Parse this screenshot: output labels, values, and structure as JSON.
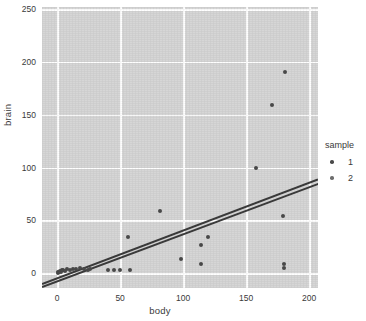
{
  "chart_data": {
    "type": "scatter",
    "title": "",
    "xlabel": "body",
    "ylabel": "brain",
    "xlim": [
      -12,
      207
    ],
    "ylim": [
      -14,
      252
    ],
    "xticks": [
      0,
      50,
      100,
      150,
      200
    ],
    "yticks": [
      0,
      50,
      100,
      150,
      200,
      250
    ],
    "grid": true,
    "legend": {
      "title": "sample",
      "position": "right",
      "entries": [
        {
          "label": "1",
          "color": "#4a4a4a"
        },
        {
          "label": "2",
          "color": "#6e6e6e"
        }
      ]
    },
    "series": [
      {
        "name": "1",
        "color": "#4a4a4a",
        "points": [
          {
            "x": 0.5,
            "y": 0.4
          },
          {
            "x": 1.0,
            "y": 0.9
          },
          {
            "x": 1.8,
            "y": 1.2
          },
          {
            "x": 2.5,
            "y": 2.0
          },
          {
            "x": 3.2,
            "y": 1.6
          },
          {
            "x": 4.0,
            "y": 2.8
          },
          {
            "x": 5.0,
            "y": 3.2
          },
          {
            "x": 6.5,
            "y": 2.4
          },
          {
            "x": 8.0,
            "y": 3.6
          },
          {
            "x": 10.0,
            "y": 3.0
          },
          {
            "x": 12.5,
            "y": 4.2
          },
          {
            "x": 15.0,
            "y": 3.8
          },
          {
            "x": 18.0,
            "y": 4.6
          },
          {
            "x": 21.0,
            "y": 4.0
          },
          {
            "x": 24.5,
            "y": 3.4
          },
          {
            "x": 26.0,
            "y": 3.6
          },
          {
            "x": 40.0,
            "y": 3.0
          },
          {
            "x": 45.0,
            "y": 2.6
          },
          {
            "x": 50.0,
            "y": 3.0
          },
          {
            "x": 57.5,
            "y": 3.2
          },
          {
            "x": 56.5,
            "y": 34.0
          },
          {
            "x": 81.5,
            "y": 59.0
          },
          {
            "x": 98.0,
            "y": 13.0
          },
          {
            "x": 114.0,
            "y": 9.0
          },
          {
            "x": 114.5,
            "y": 26.5
          },
          {
            "x": 120.0,
            "y": 34.5
          },
          {
            "x": 157.5,
            "y": 100.0
          },
          {
            "x": 170.5,
            "y": 159.0
          },
          {
            "x": 179.5,
            "y": 54.5
          },
          {
            "x": 180.0,
            "y": 8.5
          },
          {
            "x": 180.0,
            "y": 4.5
          },
          {
            "x": 181.0,
            "y": 190.5
          }
        ]
      }
    ],
    "fits": [
      {
        "name": "1",
        "color": "#3b3b3b",
        "x0": -12,
        "y0": -9.0,
        "x1": 207,
        "y1": 90.0
      },
      {
        "name": "2",
        "color": "#3b3b3b",
        "x0": -12,
        "y0": -12.5,
        "x1": 207,
        "y1": 85.0
      }
    ]
  },
  "colors": {
    "panel": "#d6d6d6",
    "grid": "#ffffff",
    "text": "#3a3a3a",
    "background": "#ffffff"
  }
}
